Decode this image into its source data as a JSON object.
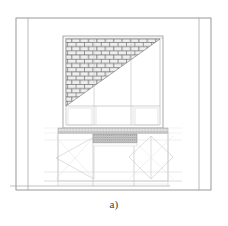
{
  "figure": {
    "caption": "a)",
    "type": "technical-line-drawing"
  },
  "colors": {
    "background": "#ffffff",
    "outer_frame_line": "#8e8e8e",
    "structural_line": "#a8a8a8",
    "thin_line": "#bdbdbd",
    "faint_line": "#d2d2d2",
    "brick_fill": "#e9e9e9",
    "brick_mortar": "#565656",
    "hatch_band": "#9a9a9a",
    "caption_text": "#3c3c3c"
  },
  "geometry": {
    "outer_border": {
      "x": 16,
      "y": 18,
      "width": 195,
      "height": 172
    },
    "left_inner_vertical_x": 28,
    "right_inner_vertical_x": 199,
    "opening_frame": {
      "x": 63,
      "y": 36,
      "width": 100,
      "height": 92
    },
    "transom_y": 106,
    "mullion_left_x": 94,
    "mullion_right_x": 131,
    "brick_triangle": {
      "apex_right_x": 160,
      "top_y": 39,
      "bottom_left_x": 66,
      "bottom_y": 106,
      "course_height": 4.2,
      "brick_width": 8.4
    },
    "sill_band": {
      "x": 58,
      "y": 128,
      "width": 110,
      "height": 5
    },
    "lower_panel": {
      "x": 58,
      "y": 133,
      "width": 110,
      "height": 52
    },
    "lower_mullion_left_x": 93,
    "lower_mullion_right_x": 134,
    "hatch_band": {
      "x": 93,
      "y": 134,
      "width": 44,
      "height": 9
    },
    "base_line_y": 181,
    "ground_line_y": 186,
    "ground_line_extent": {
      "x1": 10,
      "x2": 170
    },
    "left_diamond": {
      "cx": 75,
      "cy": 158,
      "rx": 19,
      "ry": 21
    },
    "right_diamond": {
      "cx": 151,
      "cy": 157,
      "rx": 22,
      "ry": 22
    }
  },
  "labels": {
    "outer_border_name": "Outer wall boundary",
    "opening_name": "Window opening frame",
    "infill_name": "Brick masonry infill",
    "lower_name": "Braced base panel"
  }
}
